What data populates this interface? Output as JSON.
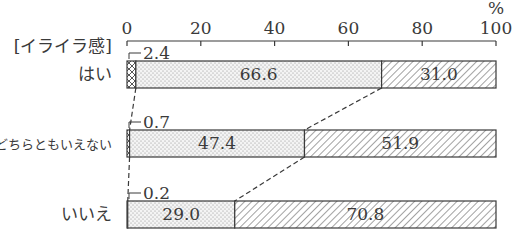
{
  "chart_data": {
    "type": "bar",
    "orientation": "horizontal",
    "stacked": true,
    "title": "",
    "group_label": "[イライラ感]",
    "xlabel": "",
    "ylabel": "",
    "unit": "%",
    "xlim": [
      0,
      100
    ],
    "xticks": [
      "0",
      "20",
      "40",
      "60",
      "80",
      "100"
    ],
    "grid": false,
    "legend": "none",
    "categories": [
      "はい",
      "どちらともいえない",
      "いいえ"
    ],
    "series": [
      {
        "name": "segment-1",
        "pattern": "crosshatch",
        "values": [
          2.4,
          0.7,
          0.2
        ],
        "labels": [
          "2.4",
          "0.7",
          "0.2"
        ]
      },
      {
        "name": "segment-2",
        "pattern": "dots",
        "values": [
          66.6,
          47.4,
          29.0
        ],
        "labels": [
          "66.6",
          "47.4",
          "29.0"
        ]
      },
      {
        "name": "segment-3",
        "pattern": "diagonal-hatch",
        "values": [
          31.0,
          51.9,
          70.8
        ],
        "labels": [
          "31.0",
          "51.9",
          "70.8"
        ]
      }
    ],
    "annotations": [
      "dashed connector lines between cumulative segment boundaries of adjacent bars"
    ]
  },
  "colors": {
    "ink": "#3a3a3a",
    "background": "#ffffff"
  }
}
